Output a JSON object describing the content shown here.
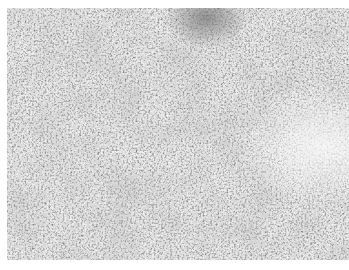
{
  "image": {
    "kind": "grayscale histology micrograph",
    "description": "Densely cellular tissue section with scattered dark nuclei on lighter stroma; darker fibrous band near top center; paler region toward right edge",
    "colors": {
      "background": "#ffffff",
      "base_tone": "#b9b9b9",
      "nuclei": "#2e2e2e",
      "stroma_light": "#e6e6e6",
      "dark_band": "#6f6f6f"
    }
  }
}
